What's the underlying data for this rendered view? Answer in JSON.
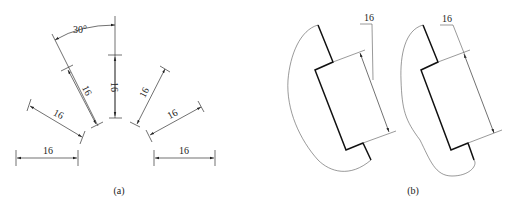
{
  "figure": {
    "panels": [
      {
        "id": "a",
        "caption": "(a)",
        "description": "Linear dimension text orientation at various angles; 30° zone marked",
        "angle_label": "30°",
        "dimensions": [
          {
            "label": "16",
            "orientation": "horizontal-left"
          },
          {
            "label": "16",
            "orientation": "30deg-left"
          },
          {
            "label": "16",
            "orientation": "60deg-left"
          },
          {
            "label": "16",
            "orientation": "vertical"
          },
          {
            "label": "16",
            "orientation": "60deg-right"
          },
          {
            "label": "16",
            "orientation": "30deg-right"
          },
          {
            "label": "16",
            "orientation": "horizontal-right"
          }
        ]
      },
      {
        "id": "b",
        "caption": "(b)",
        "description": "Dimension in the 30° zone with leader-line annotation, two variants",
        "dimensions": [
          {
            "label": "16",
            "variant": "left"
          },
          {
            "label": "16",
            "variant": "right"
          }
        ]
      }
    ]
  }
}
